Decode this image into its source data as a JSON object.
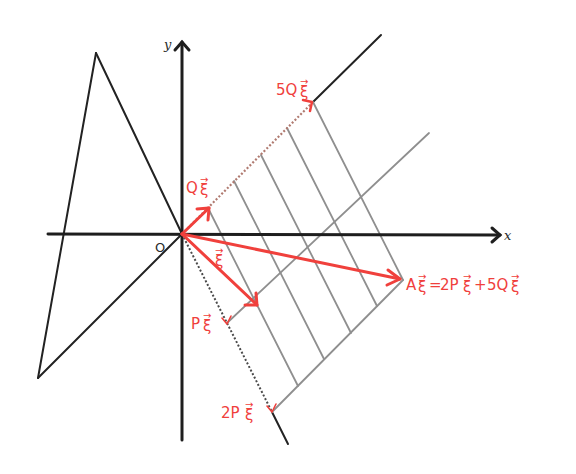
{
  "diagram": {
    "colors": {
      "axes": "#1e1e1e",
      "grid": "#8f8f8f",
      "vectors": "#f0403c"
    },
    "axes": {
      "x_label": "x",
      "y_label": "y",
      "origin_label": "O"
    },
    "labels": {
      "q": "Q x⃗",
      "five_q": "5Q x⃗",
      "p": "P x⃗",
      "two_p": "2P x⃗",
      "x": "x⃗",
      "a": "A x⃗ = 2P x⃗ + 5Q x⃗"
    },
    "label_text": {
      "q": "Q",
      "five_q": "5Q",
      "p": "P",
      "two_p": "2P",
      "x": "",
      "a_lhs": "A",
      "a_eq": "=",
      "a_term1": "2P",
      "a_plus": "+",
      "a_term2": "5Q",
      "vec_symbol": "ξ",
      "arrow": "→"
    },
    "geometry": {
      "origin": [
        182,
        234
      ],
      "p_vector": [
        45,
        89
      ],
      "q_vector": [
        26.2,
        -26.4
      ],
      "coefficients": {
        "p": 2,
        "q": 5
      },
      "grid_divisions": {
        "p": 2,
        "q": 5
      }
    }
  }
}
